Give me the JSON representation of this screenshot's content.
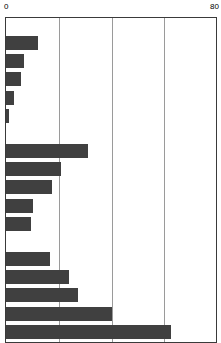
{
  "chart_data": {
    "type": "bar",
    "orientation": "horizontal",
    "title": "",
    "subtitle": "",
    "xlabel": "",
    "ylabel": "",
    "xlim": [
      0,
      80
    ],
    "ylim": null,
    "grid": true,
    "grid_axis": "x",
    "legend": null,
    "legend_position": "none",
    "bar_color": "#404040",
    "axis_color": "#3a3a3a",
    "gridline_color": "#9a9a9a",
    "background_color": "#ffffff",
    "tick_labels": [
      "0",
      "80"
    ],
    "tick_values": [
      0,
      80
    ],
    "gridline_values": [
      20,
      40,
      60
    ],
    "categories": [
      "",
      "",
      "",
      "",
      "",
      "",
      "",
      "",
      "",
      "",
      "",
      "",
      "",
      "",
      ""
    ],
    "values": [
      12.0,
      6.8,
      5.7,
      3.0,
      1.1,
      31.0,
      20.8,
      17.4,
      10.2,
      9.4,
      16.6,
      23.8,
      27.2,
      40.0,
      62.6
    ],
    "groups": [
      {
        "name": "group-1",
        "indices": [
          0,
          1,
          2,
          3,
          4
        ]
      },
      {
        "name": "group-2",
        "indices": [
          5,
          6,
          7,
          8,
          9
        ]
      },
      {
        "name": "group-3",
        "indices": [
          10,
          11,
          12,
          13,
          14
        ]
      }
    ]
  },
  "axis": {
    "left_label": "0",
    "right_label": "80"
  }
}
